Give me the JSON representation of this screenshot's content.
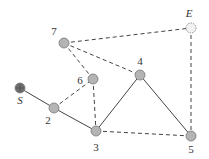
{
  "diagram": {
    "type": "graph",
    "nodes": [
      {
        "id": "S",
        "label": "S",
        "x": 20,
        "y": 88,
        "lx": 20,
        "ly": 104,
        "fill": "#6e6e6e",
        "style": "start",
        "italic": true
      },
      {
        "id": "2",
        "label": "2",
        "x": 54,
        "y": 108,
        "lx": 48,
        "ly": 124,
        "fill": "#b4b4b4",
        "style": "normal",
        "italic": false
      },
      {
        "id": "3",
        "label": "3",
        "x": 96,
        "y": 131,
        "lx": 96,
        "ly": 151,
        "fill": "#b4b4b4",
        "style": "normal",
        "italic": false
      },
      {
        "id": "4",
        "label": "4",
        "x": 140,
        "y": 75,
        "lx": 140,
        "ly": 65,
        "fill": "#b4b4b4",
        "style": "normal",
        "italic": false
      },
      {
        "id": "5",
        "label": "5",
        "x": 191,
        "y": 136,
        "lx": 191,
        "ly": 153,
        "fill": "#b4b4b4",
        "style": "normal",
        "italic": false
      },
      {
        "id": "6",
        "label": "6",
        "x": 93,
        "y": 79,
        "lx": 80,
        "ly": 84,
        "fill": "#b4b4b4",
        "style": "normal",
        "italic": false
      },
      {
        "id": "7",
        "label": "7",
        "x": 64,
        "y": 43,
        "lx": 54,
        "ly": 35,
        "fill": "#b4b4b4",
        "style": "normal",
        "italic": false
      },
      {
        "id": "E",
        "label": "E",
        "x": 191,
        "y": 28,
        "lx": 189,
        "ly": 17,
        "fill": "#f2f2f2",
        "style": "end",
        "italic": true
      }
    ],
    "edges": [
      {
        "from": "S",
        "to": "2",
        "style": "solid"
      },
      {
        "from": "2",
        "to": "3",
        "style": "solid"
      },
      {
        "from": "3",
        "to": "4",
        "style": "solid"
      },
      {
        "from": "4",
        "to": "5",
        "style": "solid"
      },
      {
        "from": "2",
        "to": "6",
        "style": "dashed"
      },
      {
        "from": "6",
        "to": "7",
        "style": "dashed"
      },
      {
        "from": "6",
        "to": "3",
        "style": "dashed"
      },
      {
        "from": "7",
        "to": "4",
        "style": "dashed"
      },
      {
        "from": "7",
        "to": "E",
        "style": "dashed"
      },
      {
        "from": "E",
        "to": "5",
        "style": "dashed"
      },
      {
        "from": "3",
        "to": "5",
        "style": "dashed"
      }
    ],
    "colors": {
      "edge": "#444444",
      "node_stroke": "#777777"
    }
  }
}
